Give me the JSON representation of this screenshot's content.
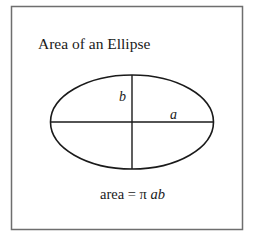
{
  "title": "Area of an Ellipse",
  "labels": {
    "semi_minor": "b",
    "semi_major": "a"
  },
  "formula": {
    "prefix": "area = π ",
    "variables": "ab"
  },
  "colors": {
    "frame": "#6e6e6e",
    "stroke": "#1a1a1a",
    "text": "#1a1a1a",
    "background": "#ffffff"
  }
}
